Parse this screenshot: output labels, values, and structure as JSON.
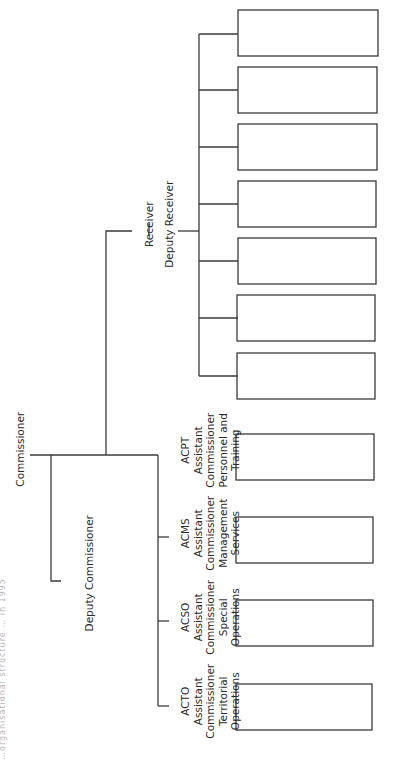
{
  "title_fragment": "…organisational structure … in 1995",
  "root": {
    "label": "Commissioner"
  },
  "deputy": {
    "label": "Deputy Commissioner"
  },
  "receiver": {
    "label": "Receiver",
    "separator": "|",
    "deputy_label": "Deputy Receiver",
    "child_box_count": 7
  },
  "assistant_commissioners": [
    {
      "code": "ACTO",
      "line1": "Assistant",
      "line2": "Commissioner",
      "line3": "Territorial",
      "line4": "Operations"
    },
    {
      "code": "ACSO",
      "line1": "Assistant",
      "line2": "Commissioner",
      "line3": "Special",
      "line4": "Operations"
    },
    {
      "code": "ACMS",
      "line1": "Assistant",
      "line2": "Commissioner",
      "line3": "Management",
      "line4": "Services"
    },
    {
      "code": "ACPT",
      "line1": "Assistant",
      "line2": "Commissioner",
      "line3": "Personnel and",
      "line4": "Training"
    }
  ],
  "colors": {
    "line": "#3a3a3a",
    "background": "#ffffff",
    "text": "#2a2a2a"
  }
}
